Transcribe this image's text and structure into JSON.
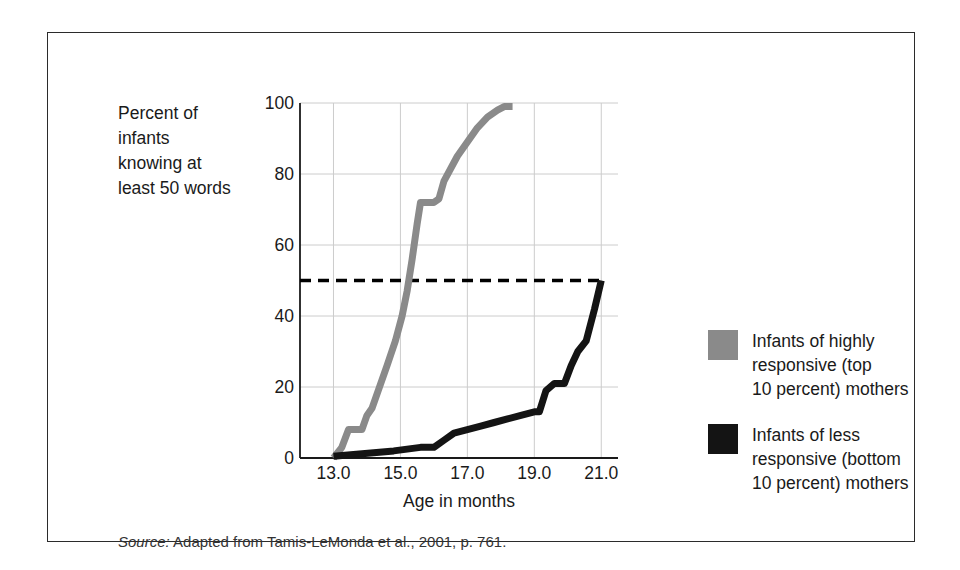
{
  "figure": {
    "y_axis_caption": "Percent of\ninfants\nknowing at\nleast 50 words",
    "x_axis_title": "Age in months",
    "source_prefix": "Source:",
    "source_text": " Adapted from Tamis-LeMonda et al., 2001, p. 761."
  },
  "legend": {
    "position": "right",
    "entries": [
      {
        "name": "highly-responsive",
        "label": "Infants of highly\nresponsive (top\n10 percent) mothers",
        "color": "#8a8a8a"
      },
      {
        "name": "less-responsive",
        "label": "Infants of less\nresponsive (bottom\n10 percent) mothers",
        "color": "#141414"
      }
    ]
  },
  "chart_data": {
    "type": "line",
    "title": "",
    "subtitle": "",
    "xlabel": "Age in months",
    "ylabel": "Percent of infants knowing at least 50 words",
    "xlim": [
      12.0,
      21.5
    ],
    "ylim": [
      0,
      100
    ],
    "grid": true,
    "x_ticks": [
      13.0,
      15.0,
      17.0,
      19.0,
      21.0
    ],
    "x_tick_labels": [
      "13.0",
      "15.0",
      "17.0",
      "19.0",
      "21.0"
    ],
    "y_ticks": [
      0,
      20,
      40,
      60,
      80,
      100
    ],
    "y_tick_labels": [
      "0",
      "20",
      "40",
      "60",
      "80",
      "100"
    ],
    "x_gridlines": [
      13.0,
      15.0,
      17.0,
      19.0,
      21.0
    ],
    "y_gridlines": [
      20,
      40,
      60,
      80,
      100
    ],
    "annotations": [
      {
        "name": "fifty-percent-reference-line",
        "type": "horizontal-dashed-line",
        "y": 50,
        "x_start": 12.0,
        "x_end": 21.0,
        "color": "#000000"
      }
    ],
    "series": [
      {
        "name": "Infants of highly responsive (top 10 percent) mothers",
        "color": "#8a8a8a",
        "linewidth": 7,
        "x": [
          13.0,
          13.25,
          13.45,
          13.55,
          13.85,
          14.0,
          14.15,
          14.6,
          14.85,
          15.05,
          15.2,
          15.35,
          15.5,
          15.6,
          16.0,
          16.15,
          16.3,
          16.7,
          17.0,
          17.3,
          17.6,
          17.9,
          18.1,
          18.35
        ],
        "y": [
          0,
          3,
          8,
          8,
          8,
          12,
          14,
          26,
          33,
          40,
          47,
          56,
          66,
          72,
          72,
          73,
          78,
          85,
          89,
          93,
          96,
          98,
          99,
          99
        ],
        "median_crossing_age": 15.25
      },
      {
        "name": "Infants of less responsive (bottom 10 percent) mothers",
        "color": "#141414",
        "linewidth": 7,
        "x": [
          13.0,
          13.6,
          14.2,
          14.8,
          15.2,
          15.6,
          16.0,
          16.3,
          16.6,
          17.0,
          17.4,
          17.8,
          18.2,
          18.6,
          19.0,
          19.15,
          19.35,
          19.6,
          19.9,
          20.1,
          20.3,
          20.55,
          20.8,
          21.0
        ],
        "y": [
          0.5,
          1,
          1.5,
          2,
          2.5,
          3,
          3,
          5,
          7,
          8,
          9,
          10,
          11,
          12,
          13,
          13,
          19,
          21,
          21,
          26,
          30,
          33,
          42,
          50
        ],
        "median_crossing_age": 21.0
      }
    ]
  }
}
